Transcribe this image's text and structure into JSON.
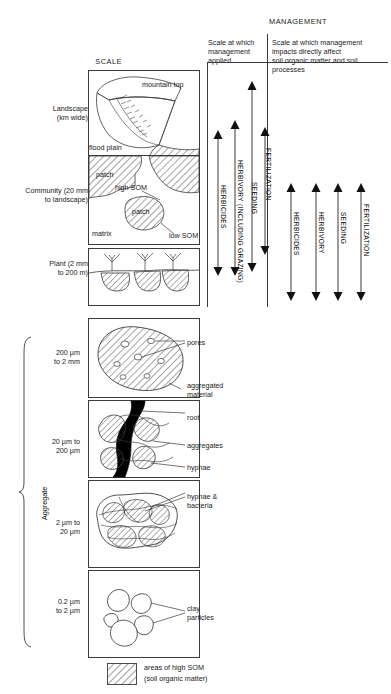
{
  "figure": {
    "headers": {
      "management": "MANAGEMENT",
      "scale": "SCALE",
      "col_applied": "Scale at which\nmanagement\napplied",
      "col_impacts": "Scale at which management\nimpacts directly affect\nsoil organic matter and soil\nprocesses"
    },
    "scale_labels": [
      {
        "id": "landscape",
        "text": "Landscape\n(km wide)"
      },
      {
        "id": "community",
        "text": "Community (20 mm\nto landscape)"
      },
      {
        "id": "plant",
        "text": "Plant (2 mm\nto 200 m)"
      },
      {
        "id": "agg1",
        "text": "200 µm\nto 2 mm"
      },
      {
        "id": "agg2",
        "text": "20 µm to\n200 µm"
      },
      {
        "id": "agg3",
        "text": "2 µm to\n20 µm"
      },
      {
        "id": "agg4",
        "text": "0.2 µm\nto 2 µm"
      }
    ],
    "brace_label": "Aggregate",
    "panel_annotations": {
      "mountain_top": "mountain top",
      "flood_plain": "flood plain",
      "patch_1": "patch",
      "patch_2": "patch",
      "high_som": "high SOM",
      "low_som": "low SOM",
      "matrix": "matrix",
      "pores": "pores",
      "aggregated_material": "aggregated\nmaterial",
      "root": "root",
      "aggregates": "aggregates",
      "hyphae": "hyphae",
      "hyphae_bacteria": "hyphae &\nbacteria",
      "clay_particles": "clay\nparticles"
    },
    "applied_arrows": [
      {
        "id": "herbicides",
        "label": "HERBICIDES"
      },
      {
        "id": "herbivory",
        "label": "HERBIVORY\n(INCLUDING GRAZING)"
      },
      {
        "id": "seeding",
        "label": "SEEDING"
      },
      {
        "id": "fertilization",
        "label": "FERTILIZATION"
      }
    ],
    "impact_arrows": [
      {
        "id": "herbicides",
        "label": "HERBICIDES"
      },
      {
        "id": "herbivory",
        "label": "HERBIVORY"
      },
      {
        "id": "seeding",
        "label": "SEEDING"
      },
      {
        "id": "fertilization",
        "label": "FERTILIZATION"
      }
    ],
    "legend": {
      "line1": "areas of high SOM",
      "line2": "(soil organic matter)"
    },
    "colors": {
      "stroke": "#3a3a3a",
      "text": "#1a1a1a",
      "root_fill": "#000000",
      "background": "#ffffff"
    }
  }
}
